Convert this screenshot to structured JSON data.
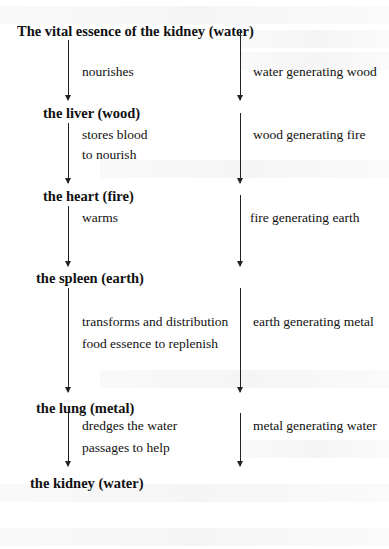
{
  "diagram": {
    "nodes": [
      "The vital essence of the kidney (water)",
      "the liver (wood)",
      "the heart (fire)",
      "the spleen (earth)",
      "the lung (metal)",
      "the kidney (water)"
    ],
    "left_labels": [
      [
        "nourishes"
      ],
      [
        "stores blood",
        "to nourish"
      ],
      [
        "warms"
      ],
      [
        "transforms and distribution",
        "food essence to replenish"
      ],
      [
        "dredges the water",
        "passages to help"
      ]
    ],
    "right_labels": [
      "water generating wood",
      "wood generating fire",
      "fire generating earth",
      "earth generating metal",
      "metal generating water"
    ]
  }
}
